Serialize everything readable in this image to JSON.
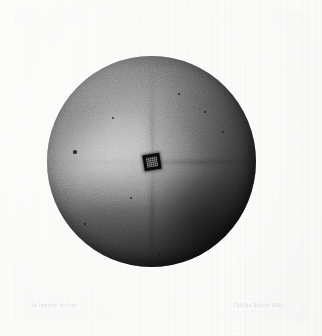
{
  "artwork": {
    "medium": "lithograph",
    "subject": "sphere",
    "title_inscription": "la lumière du jour",
    "signature_inscription": "Odilon Redon 1891",
    "background_color": "#fdfdfc",
    "sphere": {
      "label": "sphere",
      "center_x": 151,
      "center_y": 161,
      "diameter": 209,
      "highlight_color": "#f2f2f2",
      "midtone_color": "#6a6a6a",
      "shadow_color": "#101010",
      "aperture": {
        "label": "central square aperture",
        "color": "#0a0a0a",
        "inner_color": "#2c2c2c",
        "size": 17,
        "rotation_deg": -9
      },
      "star": {
        "label": "four-pointed radiance",
        "points": 4,
        "glow_color": "#ffffff",
        "directions": [
          "upper-left",
          "upper-right",
          "lower-left",
          "lower-right"
        ]
      },
      "specks": [
        {
          "x": 28,
          "y": 96,
          "r": 1.6
        },
        {
          "x": 38,
          "y": 168,
          "r": 1.3
        },
        {
          "x": 112,
          "y": 198,
          "r": 1.1
        },
        {
          "x": 158,
          "y": 56,
          "r": 1.4
        },
        {
          "x": 176,
          "y": 76,
          "r": 1.2
        },
        {
          "x": 66,
          "y": 62,
          "r": 1.0
        },
        {
          "x": 132,
          "y": 38,
          "r": 1.2
        },
        {
          "x": 190,
          "y": 142,
          "r": 1.0
        },
        {
          "x": 84,
          "y": 142,
          "r": 0.9
        },
        {
          "x": 150,
          "y": 176,
          "r": 1.0
        }
      ]
    }
  }
}
